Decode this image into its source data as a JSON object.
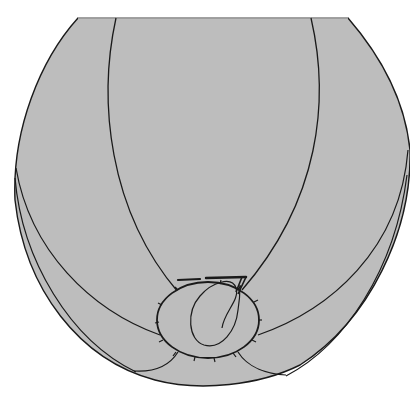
{
  "figure": {
    "description": "Grayscale line illustration of a rounded ball-like object cropped flat at the top, with curved seam lines and an oval patch near the bottom containing a loop scribble and a small 7-shaped mark with bars",
    "colors": {
      "background": "#ffffff",
      "fill": "#bdbdbd",
      "stroke": "#1a1a1a"
    },
    "elements": [
      "outer-silhouette",
      "inner-seam-left",
      "inner-seam-right",
      "side-seam-left",
      "side-seam-right",
      "outer-band-left",
      "outer-band-right",
      "oval-patch",
      "loop-scribble",
      "seven-mark",
      "bar-marks",
      "lower-flap-left",
      "lower-flap-right"
    ]
  }
}
